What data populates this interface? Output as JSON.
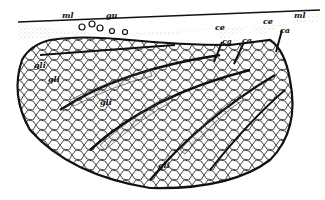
{
  "figure": {
    "labels": {
      "ml_left": "ml",
      "gu": "gu",
      "ce_1": "ce",
      "ce_2": "ce",
      "ml_right": "ml",
      "ca_1": "ca",
      "ca_2": "ca",
      "ca_3": "ca",
      "gli_1": "gli",
      "gli_2": "gli",
      "gli_3": "gli",
      "gli_4": "gli"
    },
    "colors": {
      "ink": "#111111",
      "paper": "#ffffff",
      "stipple": "#888888"
    }
  }
}
